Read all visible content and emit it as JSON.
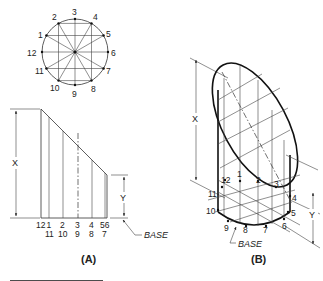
{
  "figure": {
    "panel_a": {
      "caption": "(A)",
      "circle_points": [
        "1",
        "2",
        "3",
        "4",
        "5",
        "6",
        "7",
        "8",
        "9",
        "10",
        "11",
        "12"
      ],
      "elevation_labels_top": [
        "12",
        "1",
        "2",
        "3",
        "4",
        "56"
      ],
      "elevation_labels_bottom": [
        "11",
        "10",
        "9",
        "8",
        "7"
      ],
      "dim_x": "X",
      "dim_y": "Y",
      "base_label": "BASE"
    },
    "panel_b": {
      "caption": "(B)",
      "points": [
        "1",
        "2",
        "3",
        "4",
        "5",
        "6",
        "7",
        "8",
        "9",
        "10",
        "11",
        "12"
      ],
      "dim_x": "X",
      "dim_y": "Y",
      "base_label": "BASE"
    }
  }
}
